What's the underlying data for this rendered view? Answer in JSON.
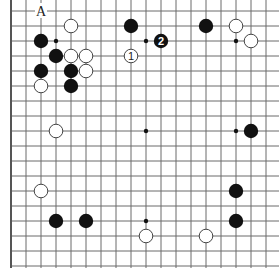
{
  "diagram": {
    "type": "go-board-partial",
    "colors": {
      "background": "#ffffff",
      "grid": "#6a6a6a",
      "black": "#111111",
      "white": "#ffffff"
    },
    "grid": {
      "origin_x": 11,
      "origin_y": 11,
      "spacing": 15,
      "cols": 19,
      "rows": 18,
      "left_edge_visible": true
    },
    "hoshi": [
      {
        "col": 3,
        "row": 2
      },
      {
        "col": 9,
        "row": 2
      },
      {
        "col": 15,
        "row": 2
      },
      {
        "col": 9,
        "row": 8
      },
      {
        "col": 15,
        "row": 8
      },
      {
        "col": 9,
        "row": 14
      }
    ],
    "stones": [
      {
        "color": "white",
        "col": 4,
        "row": 1
      },
      {
        "color": "black",
        "col": 2,
        "row": 2
      },
      {
        "color": "black",
        "col": 3,
        "row": 3
      },
      {
        "color": "white",
        "col": 4,
        "row": 3
      },
      {
        "color": "white",
        "col": 5,
        "row": 3
      },
      {
        "color": "black",
        "col": 2,
        "row": 4
      },
      {
        "color": "black",
        "col": 4,
        "row": 4
      },
      {
        "color": "white",
        "col": 5,
        "row": 4
      },
      {
        "color": "white",
        "col": 2,
        "row": 5
      },
      {
        "color": "black",
        "col": 4,
        "row": 5
      },
      {
        "color": "black",
        "col": 8,
        "row": 1
      },
      {
        "color": "white",
        "col": 8,
        "row": 3,
        "number": "1"
      },
      {
        "color": "black",
        "col": 10,
        "row": 2,
        "number": "2"
      },
      {
        "color": "black",
        "col": 13,
        "row": 1
      },
      {
        "color": "white",
        "col": 15,
        "row": 1
      },
      {
        "color": "white",
        "col": 16,
        "row": 2
      },
      {
        "color": "white",
        "col": 3,
        "row": 8
      },
      {
        "color": "black",
        "col": 16,
        "row": 8
      },
      {
        "color": "white",
        "col": 2,
        "row": 12
      },
      {
        "color": "black",
        "col": 15,
        "row": 12
      },
      {
        "color": "black",
        "col": 3,
        "row": 14
      },
      {
        "color": "black",
        "col": 5,
        "row": 14
      },
      {
        "color": "black",
        "col": 15,
        "row": 14
      },
      {
        "color": "white",
        "col": 9,
        "row": 15
      },
      {
        "color": "white",
        "col": 13,
        "row": 15
      }
    ],
    "labels": [
      {
        "text": "A",
        "col": 2,
        "row": 0
      }
    ]
  }
}
